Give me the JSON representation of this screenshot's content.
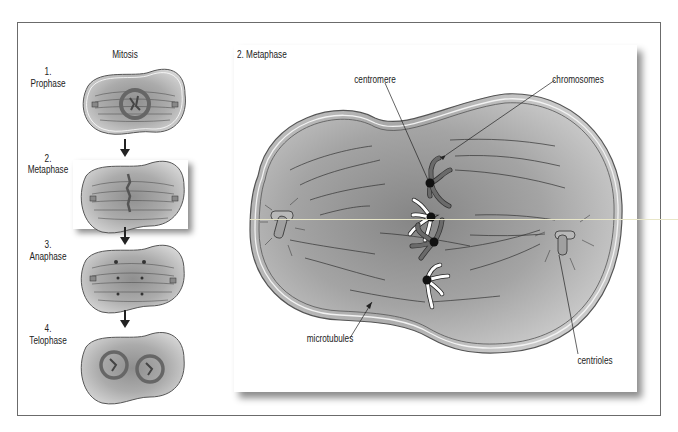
{
  "figure": {
    "left_column": {
      "title": "Mitosis",
      "stages": [
        {
          "number": "1.",
          "name": "Prophase"
        },
        {
          "number": "2.",
          "name": "Metaphase"
        },
        {
          "number": "3.",
          "name": "Anaphase"
        },
        {
          "number": "4.",
          "name": "Telophase"
        }
      ]
    },
    "detail_panel": {
      "title": "2. Metaphase",
      "labels": {
        "centromere": "centromere",
        "chromosomes": "chromosomes",
        "microtubules": "microtubules",
        "centrioles": "centrioles"
      }
    },
    "colors": {
      "frame_border": "#6b6b6b",
      "cell_fill": "#a9a9a9",
      "cell_light": "#d9d9d9",
      "chromosome_dark": "#555555",
      "chromosome_light": "#ffffff",
      "centromere": "#111111"
    }
  }
}
